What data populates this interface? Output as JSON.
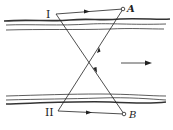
{
  "diagram": {
    "title": "",
    "labels": {
      "station_1": "I",
      "station_2": "II",
      "point_a": "A",
      "point_b": "B"
    },
    "flow_direction": "right",
    "colors": {
      "line": "#222222",
      "bank": "#333333",
      "background": "#ffffff"
    },
    "points": {
      "I": [
        56,
        14
      ],
      "A": [
        123,
        9
      ],
      "II": [
        58,
        111
      ],
      "B": [
        124,
        114
      ],
      "crossing": [
        88,
        60
      ]
    }
  }
}
